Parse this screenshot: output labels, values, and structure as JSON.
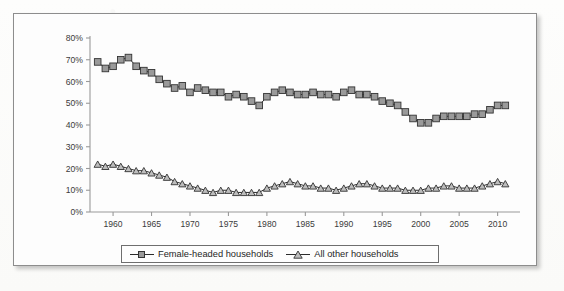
{
  "chart_data": {
    "type": "line",
    "title": "",
    "subtitle": "",
    "xlabel": "",
    "ylabel": "",
    "xlim": [
      1957,
      2012
    ],
    "ylim": [
      0,
      80
    ],
    "ytick_step": 10,
    "grid": false,
    "legend_position": "bottom-center",
    "y_tick_labels": [
      "0%",
      "10%",
      "20%",
      "30%",
      "40%",
      "50%",
      "60%",
      "70%",
      "80%"
    ],
    "y_tick_values": [
      0,
      10,
      20,
      30,
      40,
      50,
      60,
      70,
      80
    ],
    "x_tick_labels": [
      "1960",
      "1965",
      "1970",
      "1975",
      "1980",
      "1985",
      "1990",
      "1995",
      "2000",
      "2005",
      "2010"
    ],
    "x_tick_values": [
      1960,
      1965,
      1970,
      1975,
      1980,
      1985,
      1990,
      1995,
      2000,
      2005,
      2010
    ],
    "x": [
      1958,
      1959,
      1960,
      1961,
      1962,
      1963,
      1964,
      1965,
      1966,
      1967,
      1968,
      1969,
      1970,
      1971,
      1972,
      1973,
      1974,
      1975,
      1976,
      1977,
      1978,
      1979,
      1980,
      1981,
      1982,
      1983,
      1984,
      1985,
      1986,
      1987,
      1988,
      1989,
      1990,
      1991,
      1992,
      1993,
      1994,
      1995,
      1996,
      1997,
      1998,
      1999,
      2000,
      2001,
      2002,
      2003,
      2004,
      2005,
      2006,
      2007,
      2008,
      2009,
      2010,
      2011
    ],
    "series": [
      {
        "name": "Female-headed households",
        "marker": "square",
        "marker_fill": "#9a9a9a",
        "marker_edge": "#333333",
        "line_color": "#2b2b2b",
        "values": [
          69,
          66,
          67,
          70,
          71,
          67,
          65,
          64,
          61,
          59,
          57,
          58,
          55,
          57,
          56,
          55,
          55,
          53,
          54,
          53,
          51,
          49,
          53,
          55,
          56,
          55,
          54,
          54,
          55,
          54,
          54,
          53,
          55,
          56,
          54,
          54,
          53,
          51,
          50,
          49,
          46,
          43,
          41,
          41,
          43,
          44,
          44,
          44,
          44,
          45,
          45,
          47,
          49,
          49
        ],
        "unit": "%"
      },
      {
        "name": "All other households",
        "marker": "triangle",
        "marker_fill": "#bdbdbd",
        "marker_edge": "#333333",
        "line_color": "#2b2b2b",
        "values": [
          22,
          21,
          22,
          21,
          20,
          19,
          19,
          18,
          17,
          16,
          14,
          13,
          12,
          11,
          10,
          9,
          10,
          10,
          9,
          9,
          9,
          9,
          11,
          12,
          13,
          14,
          13,
          12,
          12,
          11,
          11,
          10,
          11,
          12,
          13,
          13,
          12,
          11,
          11,
          11,
          10,
          10,
          10,
          11,
          11,
          12,
          12,
          11,
          11,
          11,
          12,
          13,
          14,
          13
        ],
        "unit": "%"
      }
    ]
  },
  "legend": {
    "entries": [
      {
        "label": "Female-headed households",
        "marker": "square-marker"
      },
      {
        "label": "All other households",
        "marker": "triangle-marker"
      }
    ]
  }
}
